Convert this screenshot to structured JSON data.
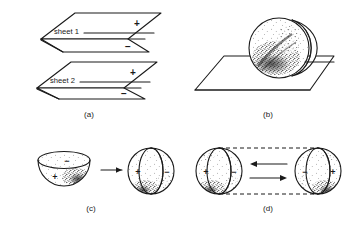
{
  "figure": {
    "background_color": "#ffffff",
    "ink_color": "#1a1a1a",
    "width": 348,
    "height": 227
  },
  "panels": [
    {
      "id": "a",
      "caption": "(a)",
      "description": "Two stacked parallelogram sheets, each split by a horizontal line with a plus charge layer above and a minus charge layer below",
      "sheets": [
        {
          "label": "sheet 1",
          "top_sign": "+",
          "bottom_sign": "−"
        },
        {
          "label": "sheet 2",
          "top_sign": "+",
          "bottom_sign": "−"
        }
      ]
    },
    {
      "id": "b",
      "caption": "(b)",
      "description": "Stippled sphere with a thin lens-shaped slice resting on a flat parallelogram plane",
      "sphere_texture": "stippled",
      "plane": "parallelogram"
    },
    {
      "id": "c",
      "caption": "(c)",
      "description": "A stippled hemisphere bowl transforms into a sphere divided by a vertical lens",
      "bowl": {
        "top_sign": "−",
        "bottom_sign": "+"
      },
      "arrow": {
        "direction": "right",
        "glyph": "→"
      },
      "sphere": {
        "left_sign": "+",
        "right_sign": "−"
      }
    },
    {
      "id": "d",
      "caption": "(d)",
      "description": "Two mirrored lens-divided spheres joined by dashed tangent lines with double equilibrium arrows between them",
      "left_sphere": {
        "outer_sign": "+",
        "lens_sign": "−"
      },
      "right_sphere": {
        "lens_sign": "−",
        "outer_sign": "+"
      },
      "arrows": [
        {
          "direction": "left",
          "glyph": "←"
        },
        {
          "direction": "right",
          "glyph": "→"
        }
      ],
      "connector": "dashed"
    }
  ],
  "captions": {
    "a": "(a)",
    "b": "(b)",
    "c": "(c)",
    "d": "(d)"
  },
  "signs": {
    "plus": "+",
    "minus": "−"
  },
  "sheet_labels": {
    "one": "sheet 1",
    "two": "sheet 2"
  }
}
